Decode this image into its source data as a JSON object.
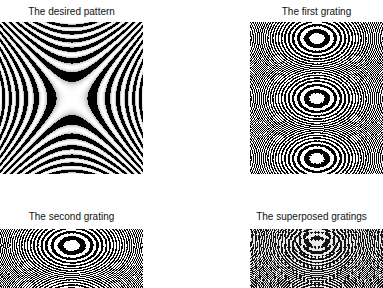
{
  "figure": {
    "panels": [
      {
        "id": "desired",
        "title": "The desired pattern",
        "pattern": "saddle",
        "box": {
          "x": 0,
          "y": 22,
          "w": 143,
          "h": 152
        },
        "title_box": {
          "x": 0,
          "y": 6,
          "w": 143
        }
      },
      {
        "id": "first",
        "title": "The first grating",
        "pattern": "ellipse",
        "box": {
          "x": 250,
          "y": 22,
          "w": 133,
          "h": 152
        },
        "title_box": {
          "x": 250,
          "y": 6,
          "w": 133
        }
      },
      {
        "id": "second",
        "title": "The second grating",
        "pattern": "ellipse-low",
        "box": {
          "x": 0,
          "y": 229,
          "w": 143,
          "h": 59
        },
        "title_box": {
          "x": 0,
          "y": 211,
          "w": 143
        }
      },
      {
        "id": "superposed",
        "title": "The superposed gratings",
        "pattern": "moire",
        "box": {
          "x": 250,
          "y": 229,
          "w": 133,
          "h": 59
        },
        "title_box": {
          "x": 240,
          "y": 211,
          "w": 143
        }
      }
    ],
    "colors": {
      "background": "#ffffff",
      "ink": "#000000",
      "title": "#111111"
    }
  }
}
